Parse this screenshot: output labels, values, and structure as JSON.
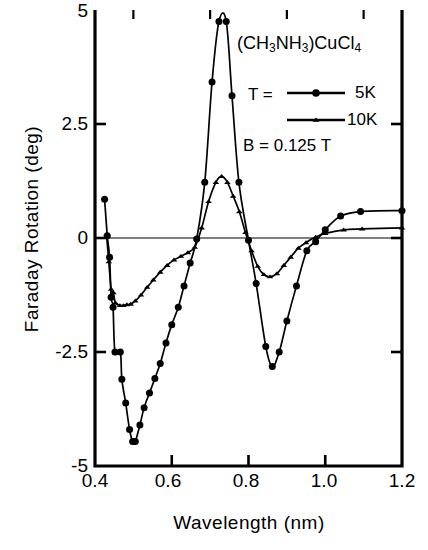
{
  "chart_data": {
    "type": "line",
    "title": "",
    "xlabel": "Wavelength  (nm)",
    "ylabel": "Faraday Rotation  (deg)",
    "xlim": [
      0.4,
      1.2
    ],
    "ylim": [
      -5,
      5
    ],
    "xticks": [
      "0.4",
      "0.6",
      "0.8",
      "1.0",
      "1.2"
    ],
    "xtick_values": [
      0.4,
      0.6,
      0.8,
      1.0,
      1.2
    ],
    "yticks": [
      "5",
      "2.5",
      "0",
      "-2.5",
      "-5"
    ],
    "ytick_values": [
      5,
      2.5,
      0,
      -2.5,
      -5
    ],
    "grid": false,
    "zero_line": true,
    "legend_position": "top-right",
    "annotations": {
      "sample_formula": "(CH3NH3)CuCl4",
      "temperature_label": "T =",
      "field_label": "B = 0.125 T"
    },
    "series": [
      {
        "name": "5K",
        "marker": "circle",
        "points": [
          [
            0.425,
            0.85
          ],
          [
            0.432,
            0.05
          ],
          [
            0.438,
            -0.42
          ],
          [
            0.442,
            -1.3
          ],
          [
            0.447,
            -1.52
          ],
          [
            0.452,
            -2.5
          ],
          [
            0.466,
            -2.5
          ],
          [
            0.47,
            -3.1
          ],
          [
            0.48,
            -3.62
          ],
          [
            0.49,
            -4.2
          ],
          [
            0.498,
            -4.46
          ],
          [
            0.505,
            -4.46
          ],
          [
            0.517,
            -4.1
          ],
          [
            0.528,
            -3.72
          ],
          [
            0.542,
            -3.4
          ],
          [
            0.556,
            -3.08
          ],
          [
            0.57,
            -2.75
          ],
          [
            0.585,
            -2.3
          ],
          [
            0.6,
            -1.9
          ],
          [
            0.617,
            -1.52
          ],
          [
            0.632,
            -1.05
          ],
          [
            0.648,
            -0.55
          ],
          [
            0.665,
            -0.02
          ],
          [
            0.686,
            1.22
          ],
          [
            0.705,
            3.42
          ],
          [
            0.723,
            4.75
          ],
          [
            0.742,
            4.75
          ],
          [
            0.757,
            3.12
          ],
          [
            0.775,
            1.22
          ],
          [
            0.8,
            -0.05
          ],
          [
            0.82,
            -1.0
          ],
          [
            0.845,
            -2.38
          ],
          [
            0.862,
            -2.82
          ],
          [
            0.88,
            -2.5
          ],
          [
            0.9,
            -1.82
          ],
          [
            0.925,
            -1.05
          ],
          [
            0.952,
            -0.28
          ],
          [
            0.975,
            -0.08
          ],
          [
            1.0,
            0.18
          ],
          [
            1.04,
            0.48
          ],
          [
            1.092,
            0.58
          ],
          [
            1.2,
            0.6
          ]
        ]
      },
      {
        "name": "10K",
        "marker": "triangle",
        "points": [
          [
            0.43,
            0.08
          ],
          [
            0.436,
            -0.52
          ],
          [
            0.442,
            -1.12
          ],
          [
            0.448,
            -1.2
          ],
          [
            0.453,
            -1.42
          ],
          [
            0.465,
            -1.48
          ],
          [
            0.474,
            -1.48
          ],
          [
            0.483,
            -1.46
          ],
          [
            0.493,
            -1.45
          ],
          [
            0.505,
            -1.38
          ],
          [
            0.52,
            -1.25
          ],
          [
            0.536,
            -1.08
          ],
          [
            0.552,
            -0.92
          ],
          [
            0.57,
            -0.75
          ],
          [
            0.588,
            -0.6
          ],
          [
            0.606,
            -0.48
          ],
          [
            0.624,
            -0.4
          ],
          [
            0.642,
            -0.32
          ],
          [
            0.66,
            -0.2
          ],
          [
            0.678,
            0.22
          ],
          [
            0.696,
            0.8
          ],
          [
            0.715,
            1.22
          ],
          [
            0.73,
            1.35
          ],
          [
            0.745,
            1.22
          ],
          [
            0.76,
            0.92
          ],
          [
            0.776,
            0.58
          ],
          [
            0.792,
            0.12
          ],
          [
            0.808,
            -0.28
          ],
          [
            0.824,
            -0.62
          ],
          [
            0.84,
            -0.8
          ],
          [
            0.856,
            -0.85
          ],
          [
            0.874,
            -0.78
          ],
          [
            0.892,
            -0.6
          ],
          [
            0.91,
            -0.42
          ],
          [
            0.93,
            -0.22
          ],
          [
            0.95,
            -0.1
          ],
          [
            0.975,
            0.02
          ],
          [
            1.0,
            0.1
          ],
          [
            1.048,
            0.18
          ],
          [
            1.096,
            0.2
          ],
          [
            1.2,
            0.22
          ]
        ]
      }
    ]
  }
}
